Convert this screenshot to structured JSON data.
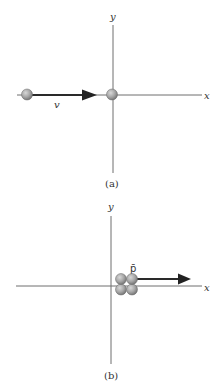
{
  "colors": {
    "axis": "#6e6e6e",
    "arrow": "#222222",
    "ball_light": "#c4c4c4",
    "ball_dark": "#7a7a7a",
    "text": "#333333"
  },
  "panel_a": {
    "caption": "(a)",
    "x_axis_label": "x",
    "y_axis_label": "y",
    "velocity_label": "v",
    "moving_particle": "ball",
    "target_particle": "ball-at-origin"
  },
  "panel_b": {
    "caption": "(b)",
    "x_axis_label": "x",
    "y_axis_label": "y",
    "momentum_label": "p̄",
    "cluster_particle_count": 4
  }
}
